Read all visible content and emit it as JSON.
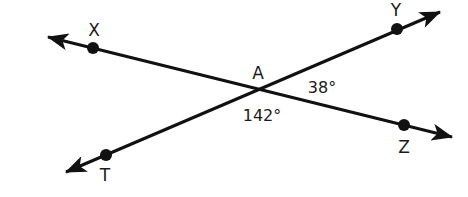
{
  "diagram": {
    "type": "intersecting-lines",
    "colors": {
      "line": "#111111",
      "text": "#1a1a1a",
      "background": "#ffffff"
    },
    "intersection": {
      "label": "A",
      "x": 258,
      "y": 89
    },
    "lines": [
      {
        "name": "line-XZ",
        "from": [
          48,
          37
        ],
        "to": [
          452,
          137
        ],
        "arrows": "both"
      },
      {
        "name": "line-TY",
        "from": [
          66,
          172
        ],
        "to": [
          440,
          12
        ],
        "arrows": "both"
      }
    ],
    "points": [
      {
        "label": "X",
        "x": 93,
        "y": 48,
        "label_x": 94,
        "label_y": 36
      },
      {
        "label": "Y",
        "x": 397,
        "y": 29,
        "label_x": 396,
        "label_y": 16
      },
      {
        "label": "Z",
        "x": 404,
        "y": 125,
        "label_x": 404,
        "label_y": 153
      },
      {
        "label": "T",
        "x": 106,
        "y": 155,
        "label_x": 105,
        "label_y": 181
      }
    ],
    "angles": [
      {
        "label": "38°",
        "x": 322,
        "y": 93
      },
      {
        "label": "142°",
        "x": 262,
        "y": 121
      }
    ]
  }
}
